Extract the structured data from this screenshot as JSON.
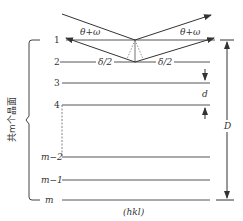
{
  "diagram": {
    "title": "",
    "angle_labels": {
      "left": "θ+ω",
      "right": "θ+ω"
    },
    "path_labels": {
      "left": "δ/2",
      "right": "δ/2"
    },
    "plane_labels": [
      "1",
      "2",
      "3",
      "4",
      "m−2",
      "m−1",
      "m"
    ],
    "spacing_label": "d",
    "thickness_label": "D",
    "miller_label": "(hkl)",
    "group_label": "共m个晶面",
    "colors": {
      "line": "#333333",
      "plane": "#555555",
      "dashed": "#666666",
      "background": "#ffffff"
    }
  }
}
